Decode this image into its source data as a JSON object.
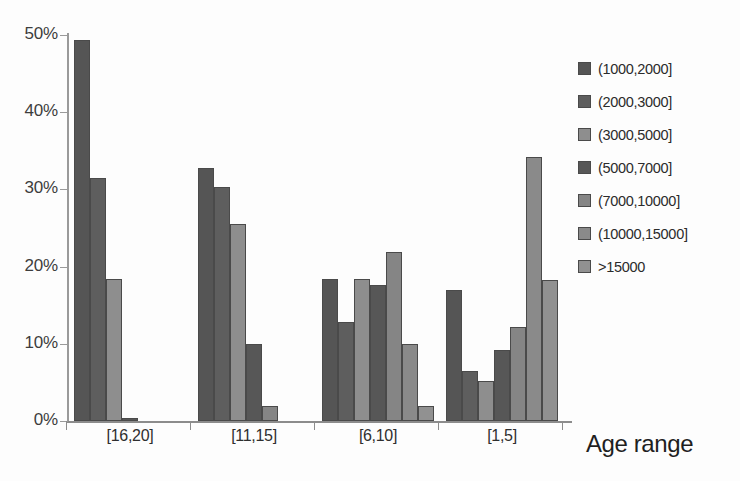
{
  "chart_data": {
    "type": "bar",
    "title": "",
    "xlabel": "Age range",
    "ylabel": "",
    "categories": [
      "[16,20]",
      "[11,15]",
      "[6,10]",
      "[1,5]"
    ],
    "ylim": [
      0,
      50
    ],
    "ytick_labels": [
      "0%",
      "10%",
      "20%",
      "30%",
      "40%",
      "50%"
    ],
    "ytick_values": [
      0,
      10,
      20,
      30,
      40,
      50
    ],
    "grid": false,
    "legend_position": "right",
    "value_suffix": "%",
    "series": [
      {
        "name": "(1000,2000]",
        "color": "#555555",
        "values": [
          49.4,
          32.8,
          18.4,
          17.0
        ]
      },
      {
        "name": "(2000,3000]",
        "color": "#5e5e5e",
        "values": [
          31.5,
          30.3,
          12.8,
          6.5
        ]
      },
      {
        "name": "(3000,5000]",
        "color": "#8e8e8e",
        "values": [
          18.4,
          25.5,
          18.4,
          5.2
        ]
      },
      {
        "name": "(5000,7000]",
        "color": "#575757",
        "values": [
          0.4,
          10.0,
          17.6,
          9.2
        ]
      },
      {
        "name": "(7000,10000]",
        "color": "#858585",
        "values": [
          0.0,
          1.9,
          21.9,
          12.2
        ]
      },
      {
        "name": "(10000,15000]",
        "color": "#8a8a8a",
        "values": [
          0.0,
          0.0,
          10.0,
          34.2
        ]
      },
      {
        "name": ">15000",
        "color": "#919191",
        "values": [
          0.0,
          0.0,
          2.0,
          18.3
        ]
      }
    ]
  },
  "axis": {
    "x_title": "Age range"
  }
}
